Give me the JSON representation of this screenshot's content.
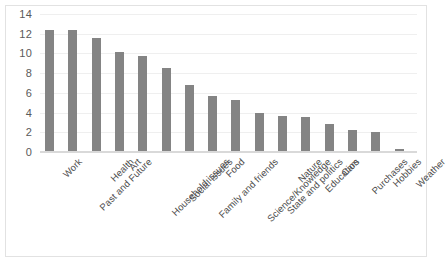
{
  "chart_data": {
    "type": "bar",
    "title": "",
    "subtitle": "",
    "xlabel": "",
    "ylabel": "",
    "ylim": [
      0,
      14
    ],
    "y_ticks": [
      0,
      2,
      4,
      6,
      8,
      10,
      12,
      14
    ],
    "grid": true,
    "legend": "none",
    "bar_color": "#848484",
    "gridline_color": "#efefef",
    "categories": [
      "Work",
      "Past and Future",
      "Health",
      "Art",
      "Household issues",
      "Social issues",
      "Family and friends",
      "Food",
      "Science/Knowledge",
      "State and politics",
      "Nature",
      "Education",
      "Cars",
      "Purchases",
      "Hobbies",
      "Weather"
    ],
    "values": [
      12.3,
      12.3,
      11.5,
      10.0,
      9.6,
      8.4,
      6.7,
      5.6,
      5.2,
      3.9,
      3.6,
      3.5,
      2.7,
      2.1,
      1.9,
      0.2
    ]
  }
}
